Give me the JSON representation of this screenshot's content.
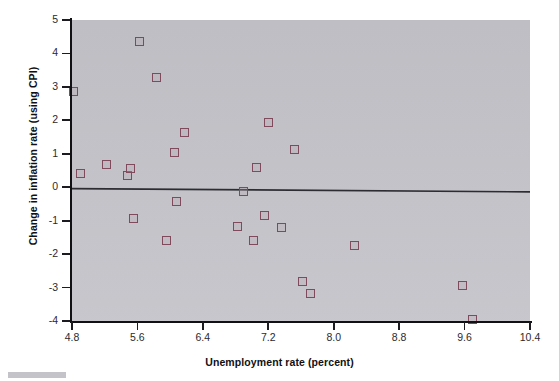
{
  "chart_data": {
    "type": "scatter",
    "title": "",
    "xlabel": "Unemployment rate (percent)",
    "ylabel": "Change in inflation rate (using CPI)",
    "xlim": [
      4.8,
      10.4
    ],
    "ylim": [
      -4,
      5
    ],
    "xticks": [
      "4.8",
      "5.6",
      "6.4",
      "7.2",
      "8.0",
      "8.8",
      "9.6",
      "10.4"
    ],
    "xtick_values": [
      4.8,
      5.6,
      6.4,
      7.2,
      8.0,
      8.8,
      9.6,
      10.4
    ],
    "yticks": [
      "5",
      "4",
      "3",
      "2",
      "1",
      "0",
      "-1",
      "-2",
      "-3",
      "-4"
    ],
    "ytick_values": [
      5,
      4,
      3,
      2,
      1,
      0,
      -1,
      -2,
      -3,
      -4
    ],
    "grid": false,
    "legend": false,
    "marker_style": "open-square",
    "marker_color": "#7e4a5c",
    "plot_background": "#c4c4ca",
    "page_background": "#ffffff",
    "axis_color": "#111114",
    "points": [
      {
        "x": 4.82,
        "y": 2.85
      },
      {
        "x": 4.9,
        "y": 0.4
      },
      {
        "x": 5.22,
        "y": 0.68
      },
      {
        "x": 5.48,
        "y": 0.36
      },
      {
        "x": 5.52,
        "y": 0.55
      },
      {
        "x": 5.55,
        "y": -0.95
      },
      {
        "x": 5.62,
        "y": 4.35
      },
      {
        "x": 5.83,
        "y": 3.28
      },
      {
        "x": 5.95,
        "y": -1.6
      },
      {
        "x": 6.05,
        "y": 1.05
      },
      {
        "x": 6.08,
        "y": -0.42
      },
      {
        "x": 6.18,
        "y": 1.65
      },
      {
        "x": 6.82,
        "y": -1.18
      },
      {
        "x": 6.9,
        "y": -0.12
      },
      {
        "x": 7.02,
        "y": -1.58
      },
      {
        "x": 7.05,
        "y": 0.6
      },
      {
        "x": 7.15,
        "y": -0.85
      },
      {
        "x": 7.2,
        "y": 1.95
      },
      {
        "x": 7.36,
        "y": -1.2
      },
      {
        "x": 7.52,
        "y": 1.12
      },
      {
        "x": 7.62,
        "y": -2.82
      },
      {
        "x": 7.72,
        "y": -3.18
      },
      {
        "x": 8.25,
        "y": -1.75
      },
      {
        "x": 9.58,
        "y": -2.95
      },
      {
        "x": 9.7,
        "y": -3.95
      }
    ],
    "trend_line": {
      "description": "fitted regression line, near-horizontal slightly negative slope",
      "x0": 4.8,
      "y0": -0.04,
      "x1": 10.4,
      "y1": -0.14,
      "color": "#2c2c32"
    }
  }
}
